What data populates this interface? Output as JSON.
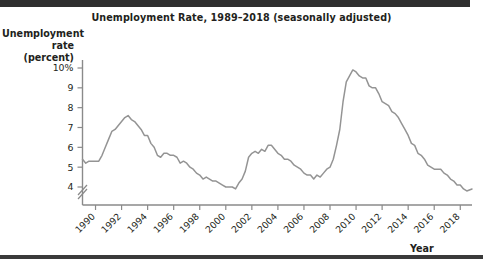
{
  "figure": {
    "title": "Unemployment Rate, 1989–2018 (seasonally adjusted)",
    "y_axis_title_line1": "Unemployment",
    "y_axis_title_line2": "rate (percent)",
    "x_axis_title": "Year",
    "line_color": "#949494",
    "axis_color": "#8a8a8a",
    "rule_color": "#2f2f2f",
    "text_color": "#231f20"
  },
  "chart_data": {
    "type": "line",
    "title": "Unemployment Rate, 1989–2018 (seasonally adjusted)",
    "xlabel": "Year",
    "ylabel": "Unemployment rate (percent)",
    "xlim": [
      1989.0,
      2018.9
    ],
    "ylim": [
      3.5,
      10.4
    ],
    "grid": false,
    "legend": null,
    "axis_break_below": 4,
    "y_ticks": [
      4,
      5,
      6,
      7,
      8,
      9,
      10
    ],
    "y_tick_labels": [
      "4",
      "5",
      "6",
      "7",
      "8",
      "9",
      "10%"
    ],
    "x_ticks": [
      1990,
      1992,
      1994,
      1996,
      1998,
      2000,
      2002,
      2004,
      2006,
      2008,
      2010,
      2012,
      2014,
      2016,
      2018
    ],
    "x_tick_labels": [
      "1990",
      "1992",
      "1994",
      "1996",
      "1998",
      "2000",
      "2002",
      "2004",
      "2006",
      "2008",
      "2010",
      "2012",
      "2014",
      "2016",
      "2018"
    ],
    "series": [
      {
        "name": "Unemployment rate",
        "color": "#949494",
        "x": [
          1989.0,
          1989.25,
          1989.5,
          1989.75,
          1990.0,
          1990.25,
          1990.5,
          1990.75,
          1991.0,
          1991.25,
          1991.5,
          1991.75,
          1992.0,
          1992.25,
          1992.5,
          1992.75,
          1993.0,
          1993.25,
          1993.5,
          1993.75,
          1994.0,
          1994.25,
          1994.5,
          1994.75,
          1995.0,
          1995.25,
          1995.5,
          1995.75,
          1996.0,
          1996.25,
          1996.5,
          1996.75,
          1997.0,
          1997.25,
          1997.5,
          1997.75,
          1998.0,
          1998.25,
          1998.5,
          1998.75,
          1999.0,
          1999.25,
          1999.5,
          1999.75,
          2000.0,
          2000.25,
          2000.5,
          2000.75,
          2001.0,
          2001.25,
          2001.5,
          2001.75,
          2002.0,
          2002.25,
          2002.5,
          2002.75,
          2003.0,
          2003.25,
          2003.5,
          2003.75,
          2004.0,
          2004.25,
          2004.5,
          2004.75,
          2005.0,
          2005.25,
          2005.5,
          2005.75,
          2006.0,
          2006.25,
          2006.5,
          2006.75,
          2007.0,
          2007.25,
          2007.5,
          2007.75,
          2008.0,
          2008.25,
          2008.5,
          2008.75,
          2009.0,
          2009.25,
          2009.5,
          2009.75,
          2010.0,
          2010.25,
          2010.5,
          2010.75,
          2011.0,
          2011.25,
          2011.5,
          2011.75,
          2012.0,
          2012.25,
          2012.5,
          2012.75,
          2013.0,
          2013.25,
          2013.5,
          2013.75,
          2014.0,
          2014.25,
          2014.5,
          2014.75,
          2015.0,
          2015.25,
          2015.5,
          2015.75,
          2016.0,
          2016.25,
          2016.5,
          2016.75,
          2017.0,
          2017.25,
          2017.5,
          2017.75,
          2018.0,
          2018.25,
          2018.5,
          2018.9
        ],
        "y": [
          5.4,
          5.2,
          5.3,
          5.3,
          5.3,
          5.3,
          5.6,
          6.0,
          6.4,
          6.8,
          6.9,
          7.1,
          7.3,
          7.5,
          7.6,
          7.4,
          7.3,
          7.1,
          6.9,
          6.6,
          6.6,
          6.2,
          6.0,
          5.6,
          5.5,
          5.7,
          5.7,
          5.6,
          5.6,
          5.5,
          5.2,
          5.3,
          5.2,
          5.0,
          4.9,
          4.7,
          4.6,
          4.4,
          4.5,
          4.4,
          4.3,
          4.3,
          4.2,
          4.1,
          4.0,
          4.0,
          4.0,
          3.9,
          4.2,
          4.4,
          4.8,
          5.5,
          5.7,
          5.8,
          5.7,
          5.9,
          5.8,
          6.1,
          6.1,
          5.9,
          5.7,
          5.6,
          5.4,
          5.4,
          5.3,
          5.1,
          5.0,
          4.9,
          4.7,
          4.6,
          4.6,
          4.4,
          4.6,
          4.5,
          4.7,
          4.9,
          5.0,
          5.4,
          6.1,
          6.9,
          8.3,
          9.3,
          9.6,
          9.9,
          9.8,
          9.6,
          9.5,
          9.5,
          9.1,
          9.0,
          9.0,
          8.7,
          8.3,
          8.2,
          8.1,
          7.8,
          7.7,
          7.5,
          7.2,
          6.9,
          6.6,
          6.2,
          6.1,
          5.7,
          5.6,
          5.4,
          5.1,
          5.0,
          4.9,
          4.9,
          4.9,
          4.7,
          4.6,
          4.4,
          4.3,
          4.1,
          4.1,
          3.9,
          3.8,
          3.9
        ]
      }
    ]
  }
}
